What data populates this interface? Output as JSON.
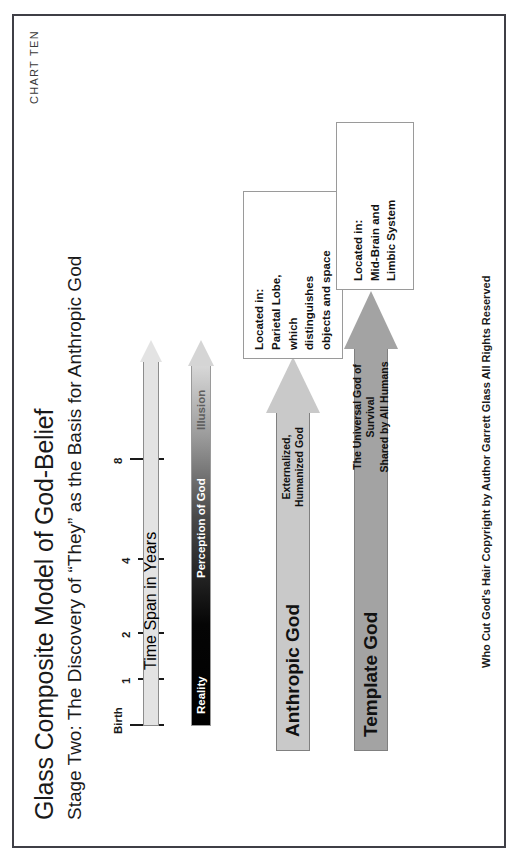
{
  "page": {
    "chart_id": "CHART TEN",
    "title": "Glass Composite Model of God-Belief",
    "subtitle": "Stage Two: The Discovery of “They” as the Basis for Anthropic God",
    "footer_credit": "Who Cut God's Hair   Copyright by Author Garrett Glass   All Rights Reserved"
  },
  "arrows": {
    "anthropic": {
      "name": "Anthropic God",
      "desc_line1": "Externalized,",
      "desc_line2": "Humanized God",
      "color": "#c9c9c9"
    },
    "template": {
      "name": "Template God",
      "desc_line1": "The Universal God of Survival",
      "desc_line2": "Shared by All Humans",
      "color": "#a3a3a3"
    },
    "timeline": {
      "axis_title": "Time Span in Years",
      "color": "#e3e3e3"
    },
    "perception": {
      "axis_title": "Perception of God",
      "low_end_label": "Reality",
      "high_end_label": "Illusion",
      "gradient_from": "#000000",
      "gradient_to": "#d8d8d8"
    }
  },
  "callouts": [
    {
      "id": "parietal",
      "line1": "Located in:",
      "line2": "Parietal Lobe,",
      "line3": "which",
      "line4": "distinguishes",
      "line5": "objects and space"
    },
    {
      "id": "midbrain",
      "line1": "Located in:",
      "line2": "Mid-Brain and",
      "line3": "Limbic System"
    }
  ],
  "chart_data": {
    "type": "diagram",
    "title": "Glass Composite Model of God-Belief",
    "subtitle": "Stage Two: The Discovery of “They” as the Basis for Anthropic God",
    "xlabel": "Time Span in Years",
    "ylabel": "Perception of God",
    "x_tick_labels": [
      "Birth",
      "1",
      "2",
      "4",
      "8"
    ],
    "x_tick_positions_px": [
      0,
      46,
      92,
      166,
      266
    ],
    "ylim_labels": [
      "Reality",
      "Illusion"
    ],
    "grid": false,
    "legend": "none",
    "series": [
      {
        "name": "Anthropic God",
        "label": "Externalized, Humanized God",
        "start_x_label": "Birth",
        "shade": "#c9c9c9",
        "note": "Located in: Parietal Lobe, which distinguishes objects and space"
      },
      {
        "name": "Template God",
        "label": "The Universal God of Survival Shared by All Humans",
        "start_x_label": "Birth",
        "shade": "#a3a3a3",
        "note": "Located in: Mid-Brain and Limbic System"
      }
    ],
    "annotations": [
      "Reality",
      "Illusion",
      "Perception of God",
      "Time Span in Years"
    ]
  },
  "ticks": [
    {
      "label": "Birth",
      "x": 0,
      "label_x": -8,
      "height": 34
    },
    {
      "label": "1",
      "x": 46,
      "label_x": 42,
      "height": 26
    },
    {
      "label": "2",
      "x": 92,
      "label_x": 88,
      "height": 26
    },
    {
      "label": "4",
      "x": 166,
      "label_x": 162,
      "height": 26
    },
    {
      "label": "8",
      "x": 266,
      "label_x": 262,
      "height": 34
    }
  ]
}
